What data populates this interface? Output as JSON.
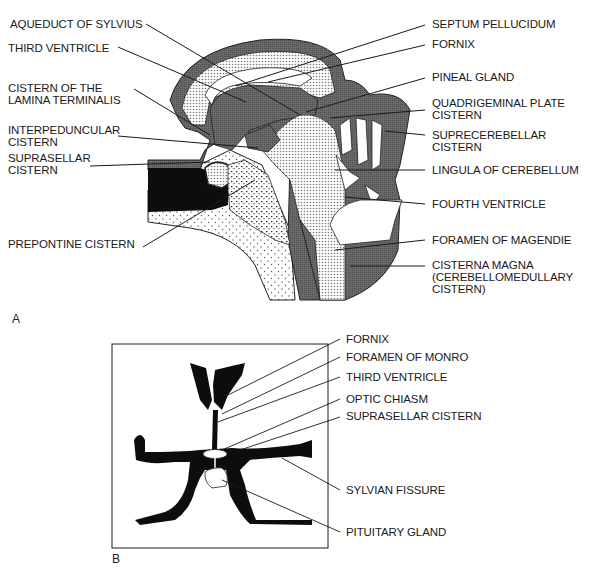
{
  "panel_a": {
    "letter": "A",
    "title": "Midsagittal view of ventricles and CSF cisterns",
    "left_labels": [
      {
        "id": "aqueduct",
        "text": "AQUEDUCT OF SYLVIUS"
      },
      {
        "id": "third_ventricle",
        "text": "THIRD VENTRICLE"
      },
      {
        "id": "lamina_terminalis_1",
        "text": "CISTERN OF THE"
      },
      {
        "id": "lamina_terminalis_2",
        "text": "LAMINA TERMINALIS"
      },
      {
        "id": "interpeduncular_1",
        "text": "INTERPEDUNCULAR"
      },
      {
        "id": "interpeduncular_2",
        "text": "CISTERN"
      },
      {
        "id": "suprasellar_1",
        "text": "SUPRASELLAR"
      },
      {
        "id": "suprasellar_2",
        "text": "CISTERN"
      },
      {
        "id": "prepontine",
        "text": "PREPONTINE CISTERN"
      }
    ],
    "right_labels": [
      {
        "id": "septum",
        "text": "SEPTUM PELLUCIDUM"
      },
      {
        "id": "fornix",
        "text": "FORNIX"
      },
      {
        "id": "pineal",
        "text": "PINEAL GLAND"
      },
      {
        "id": "quadrigeminal_1",
        "text": "QUADRIGEMINAL PLATE"
      },
      {
        "id": "quadrigeminal_2",
        "text": "CISTERN"
      },
      {
        "id": "suprecerebellar_1",
        "text": "SUPRECEREBELLAR"
      },
      {
        "id": "suprecerebellar_2",
        "text": "CISTERN"
      },
      {
        "id": "lingula",
        "text": "LINGULA OF CEREBELLUM"
      },
      {
        "id": "fourth_ventricle",
        "text": "FOURTH VENTRICLE"
      },
      {
        "id": "magendie",
        "text": "FORAMEN OF MAGENDIE"
      },
      {
        "id": "cisterna_magna_1",
        "text": "CISTERNA MAGNA"
      },
      {
        "id": "cisterna_magna_2",
        "text": "(CEREBELLOMEDULLARY"
      },
      {
        "id": "cisterna_magna_3",
        "text": "CISTERN)"
      }
    ]
  },
  "panel_b": {
    "letter": "B",
    "title": "Coronal view of suprasellar region",
    "labels": [
      {
        "id": "fornix",
        "text": "FORNIX"
      },
      {
        "id": "monro",
        "text": "FORAMEN OF MONRO"
      },
      {
        "id": "third_ventricle",
        "text": "THIRD VENTRICLE"
      },
      {
        "id": "optic_chiasm",
        "text": "OPTIC CHIASM"
      },
      {
        "id": "suprasellar",
        "text": "SUPRASELLAR CISTERN"
      },
      {
        "id": "sylvian",
        "text": "SYLVIAN FISSURE"
      },
      {
        "id": "pituitary",
        "text": "PITUITARY GLAND"
      }
    ]
  },
  "colors": {
    "csf_gray": "#5e5e5e",
    "black": "#0d0d0d",
    "stipple_bg": "#dcdcdc",
    "line": "#1a1a1a"
  }
}
